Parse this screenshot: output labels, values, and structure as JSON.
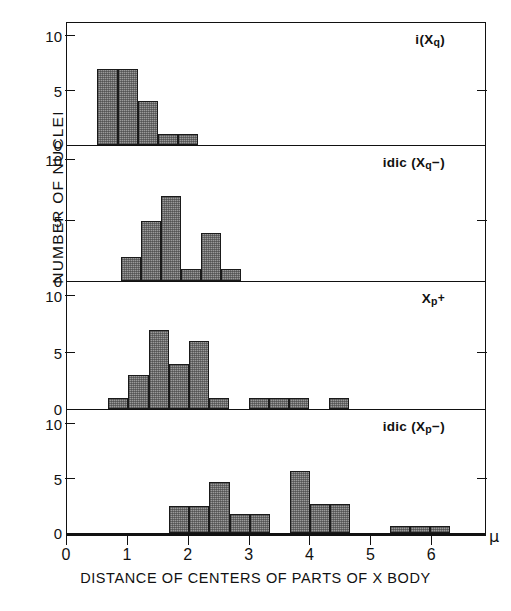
{
  "chart_data": {
    "type": "bar",
    "title": "",
    "xlabel": "DISTANCE OF CENTERS OF PARTS OF X BODY",
    "ylabel": "NUMBER OF NUCLEI",
    "x_unit": "μ",
    "xlim": [
      0,
      6.9
    ],
    "ylim": [
      0,
      10
    ],
    "xticks": [
      0,
      1,
      2,
      3,
      4,
      5,
      6
    ],
    "xticklabels": [
      "0",
      "1",
      "2",
      "3",
      "4",
      "5",
      "6"
    ],
    "yticks": [
      0,
      5,
      10
    ],
    "yticklabels": [
      "0",
      "5",
      "10"
    ],
    "grid": false,
    "legend": "none",
    "bar_width": 0.33,
    "panels": [
      {
        "label": "i(Xq)",
        "label_parts": {
          "prefix": "i(X",
          "sub": "q",
          "suffix": ")"
        },
        "bins": [
          0.5,
          0.83,
          1.16,
          1.49,
          1.82
        ],
        "values": [
          7,
          7,
          4,
          1,
          1
        ]
      },
      {
        "label": "idic (Xq−)",
        "label_parts": {
          "prefix": "idic (X",
          "sub": "q",
          "suffix": "−)"
        },
        "bins": [
          0.88,
          1.21,
          1.54,
          1.87,
          2.2,
          2.53
        ],
        "values": [
          2,
          5,
          7,
          1,
          4,
          1
        ]
      },
      {
        "label": "Xp+",
        "label_parts": {
          "prefix": "X",
          "sub": "p",
          "suffix": "+"
        },
        "bins": [
          0.68,
          1.01,
          1.34,
          1.67,
          2.0,
          2.33,
          2.99,
          3.32,
          3.65,
          4.31
        ],
        "values": [
          1,
          3,
          7,
          4,
          6,
          1,
          1,
          1,
          1,
          1
        ]
      },
      {
        "label": "idic (Xp−)",
        "label_parts": {
          "prefix": "idic (X",
          "sub": "p",
          "suffix": "−)"
        },
        "bins": [
          1.68,
          2.01,
          2.34,
          2.67,
          3.0,
          3.66,
          3.99,
          4.32,
          5.31,
          5.64,
          5.97
        ],
        "values": [
          2.5,
          2.5,
          4.7,
          1.7,
          1.7,
          5.7,
          2.7,
          2.7,
          0.6,
          0.6,
          0.6
        ]
      }
    ],
    "colors": {
      "bar_fill": "#9a9a9a",
      "bar_edge": "#1a1a1a",
      "axis": "#111111",
      "background": "#ffffff"
    }
  }
}
